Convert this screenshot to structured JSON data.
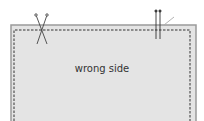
{
  "diagram": {
    "label": "wrong side",
    "colors": {
      "fabric": "#e4e4e4",
      "edge": "#9a9a9a",
      "stitch": "#333333",
      "pin": "#444444"
    }
  }
}
